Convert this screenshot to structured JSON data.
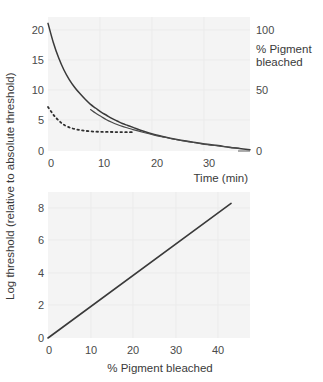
{
  "figure": {
    "background_color": "#ffffff",
    "panel_color": "#f4f4f4",
    "line_color": "#3a3a3a"
  },
  "shared_y_axis_title": "Log threshold (relative to absolute threshold)",
  "chart_data": [
    {
      "type": "line",
      "id": "dark-adaptation-time-course",
      "title": "",
      "xlabel": "Time (min)",
      "ylabel": "Log threshold (relative to absolute threshold)",
      "y2label": "% Pigment bleached",
      "xlim": [
        0,
        38
      ],
      "ylim": [
        0,
        21
      ],
      "y2lim": [
        0,
        105
      ],
      "grid": true,
      "legend_position": "none",
      "xticks": [
        0,
        10,
        20,
        30
      ],
      "xticklabels": [
        "0",
        "10",
        "20",
        "30"
      ],
      "yticks": [
        0,
        5,
        10,
        15,
        20
      ],
      "yticklabels": [
        "0",
        "5",
        "10",
        "15",
        "20"
      ],
      "y2ticks": [
        0,
        50,
        100
      ],
      "y2ticklabels": [
        "0",
        "50",
        "100"
      ],
      "series": [
        {
          "name": "cone-rod combined threshold (solid)",
          "style": "solid",
          "x": [
            0,
            1,
            2,
            3,
            4,
            5,
            6,
            7,
            8,
            9,
            10,
            11,
            12,
            13,
            14,
            15,
            16,
            18,
            20,
            22,
            24,
            26,
            28,
            30,
            32,
            34,
            36,
            38
          ],
          "y": [
            20.0,
            17.0,
            14.6,
            12.7,
            11.2,
            10.0,
            9.0,
            8.1,
            7.3,
            6.7,
            6.1,
            5.6,
            5.1,
            4.7,
            4.3,
            4.0,
            3.7,
            3.1,
            2.6,
            2.2,
            1.85,
            1.55,
            1.3,
            1.05,
            0.85,
            0.6,
            0.4,
            0.2
          ]
        },
        {
          "name": "rod branch (thin solid, later onset)",
          "style": "solid-thin",
          "x": [
            8,
            9,
            10,
            11,
            12,
            13,
            14,
            15,
            16,
            18,
            20,
            22,
            24,
            26,
            28,
            30,
            32,
            34,
            36
          ],
          "y": [
            6.5,
            5.9,
            5.4,
            4.9,
            4.5,
            4.15,
            3.85,
            3.6,
            3.35,
            2.9,
            2.5,
            2.15,
            1.8,
            1.5,
            1.25,
            1.0,
            0.8,
            0.6,
            0.42
          ]
        },
        {
          "name": "pigment regeneration (dotted)",
          "style": "dotted",
          "x": [
            0,
            0.5,
            1,
            1.5,
            2,
            2.5,
            3,
            4,
            5,
            6,
            7,
            8,
            9,
            10,
            11,
            12,
            13,
            14,
            15,
            16
          ],
          "y": [
            6.9,
            6.3,
            5.7,
            5.2,
            4.8,
            4.4,
            4.1,
            3.7,
            3.45,
            3.28,
            3.16,
            3.08,
            3.03,
            3.0,
            2.99,
            2.98,
            2.97,
            2.96,
            2.95,
            2.94
          ]
        }
      ]
    },
    {
      "type": "line",
      "id": "threshold-vs-pigment-bleached",
      "title": "",
      "xlabel": "% Pigment bleached",
      "ylabel": "Log threshold (relative to absolute threshold)",
      "xlim": [
        0,
        48
      ],
      "ylim": [
        0,
        9
      ],
      "grid": true,
      "legend_position": "none",
      "xticks": [
        0,
        10,
        20,
        30,
        40
      ],
      "xticklabels": [
        "0",
        "10",
        "20",
        "30",
        "40"
      ],
      "yticks": [
        0,
        2,
        4,
        6,
        8
      ],
      "yticklabels": [
        "0",
        "2",
        "4",
        "6",
        "8"
      ],
      "series": [
        {
          "name": "linear relation",
          "style": "solid",
          "x": [
            0,
            43.5
          ],
          "y": [
            0,
            8.3
          ]
        }
      ]
    }
  ]
}
